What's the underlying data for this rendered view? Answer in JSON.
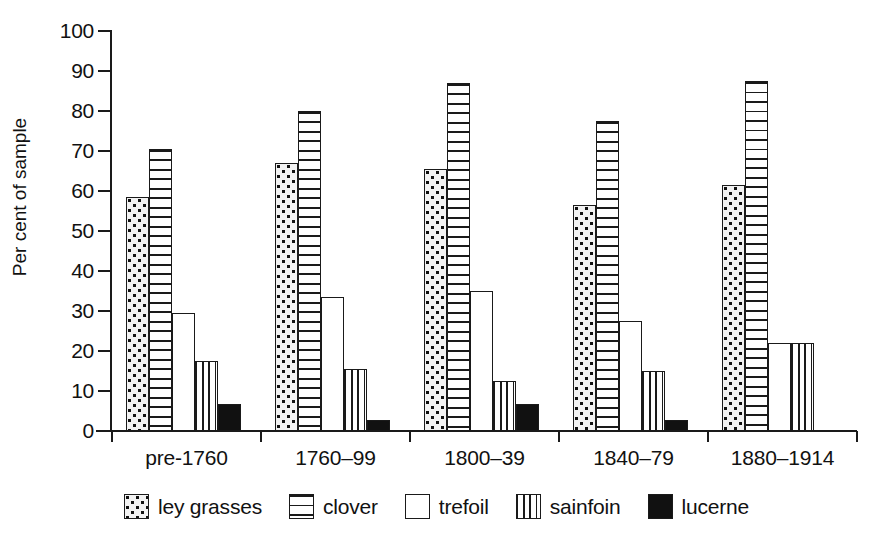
{
  "chart_data": {
    "type": "bar",
    "title": "",
    "xlabel": "",
    "ylabel": "Per cent of sample",
    "ylim": [
      0,
      100
    ],
    "ytick_values": [
      0,
      10,
      20,
      30,
      40,
      50,
      60,
      70,
      80,
      90,
      100
    ],
    "ytick_labels": [
      "0",
      "10",
      "20",
      "30",
      "40",
      "50",
      "60",
      "70",
      "80",
      "90",
      "100"
    ],
    "grid": false,
    "legend_position": "bottom",
    "categories": [
      "pre-1760",
      "1760–99",
      "1800–39",
      "1840–79",
      "1880–1914"
    ],
    "series": [
      {
        "name": "ley grasses",
        "pattern": "checkerboard-dots",
        "values": [
          58.5,
          67,
          65.5,
          56.5,
          61.5
        ]
      },
      {
        "name": "clover",
        "pattern": "horizontal-lines",
        "values": [
          70.5,
          80,
          87,
          77.5,
          87.5
        ]
      },
      {
        "name": "trefoil",
        "pattern": "solid-white",
        "values": [
          29.5,
          33.5,
          35,
          27.5,
          22
        ]
      },
      {
        "name": "sainfoin",
        "pattern": "vertical-lines",
        "values": [
          17.5,
          15.5,
          12.5,
          15,
          22
        ]
      },
      {
        "name": "lucerne",
        "pattern": "solid-black",
        "values": [
          6.8,
          2.8,
          6.8,
          2.8,
          0
        ]
      }
    ]
  },
  "axis": {
    "y_title": "Per cent of sample"
  },
  "legend": {
    "items": [
      {
        "label": "ley grasses",
        "swatch": "checkerboard-dots-swatch"
      },
      {
        "label": "clover",
        "swatch": "horizontal-lines-swatch"
      },
      {
        "label": "trefoil",
        "swatch": "solid-white-swatch"
      },
      {
        "label": "sainfoin",
        "swatch": "vertical-lines-swatch"
      },
      {
        "label": "lucerne",
        "swatch": "solid-black-swatch"
      }
    ]
  }
}
